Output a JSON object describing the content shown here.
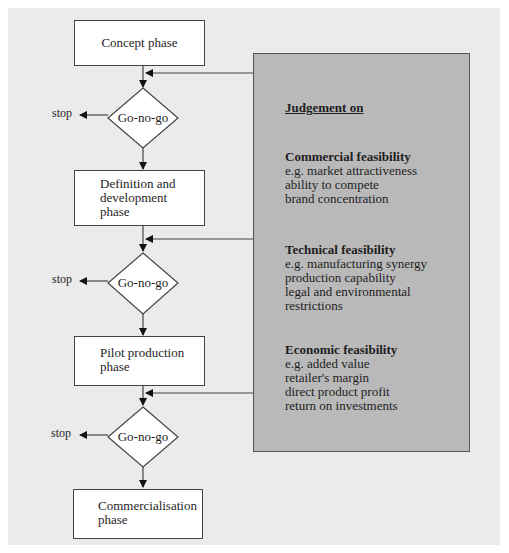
{
  "flow": {
    "phases": [
      {
        "label_lines": [
          "Concept phase"
        ]
      },
      {
        "label_lines": [
          "Definition and",
          "development",
          "phase"
        ]
      },
      {
        "label_lines": [
          "Pilot production",
          "phase"
        ]
      },
      {
        "label_lines": [
          "Commercialisation",
          "phase"
        ]
      }
    ],
    "decisions": [
      {
        "label": "Go-no-go",
        "exit_label": "stop"
      },
      {
        "label": "Go-no-go",
        "exit_label": "stop"
      },
      {
        "label": "Go-no-go",
        "exit_label": "stop"
      }
    ]
  },
  "judgement": {
    "title": "Judgement  on",
    "sections": [
      {
        "heading": "Commercial feasibility",
        "lines": [
          "e.g. market attractiveness",
          "ability to compete",
          "brand concentration"
        ]
      },
      {
        "heading": "Technical feasibility",
        "lines": [
          "e.g. manufacturing synergy",
          "production capability",
          "legal and environmental restrictions"
        ]
      },
      {
        "heading": "Economic feasibility",
        "lines": [
          "e.g. added value",
          "retailer's margin",
          "direct product profit",
          "return on investments"
        ]
      }
    ]
  },
  "colors": {
    "panel": "#ebebeb",
    "judgement_box": "#b9b9b9",
    "box": "#ffffff",
    "line": "#444444"
  }
}
